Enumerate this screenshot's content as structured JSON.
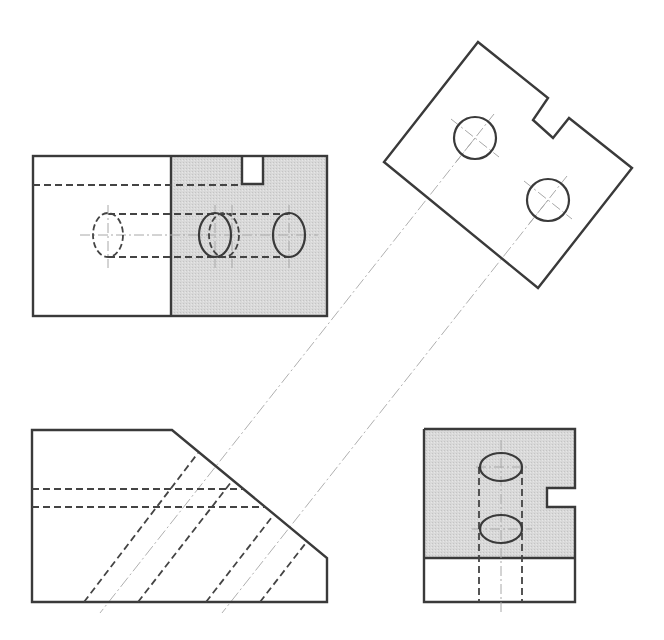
{
  "drawing": {
    "type": "orthographic-projection-with-auxiliary-view",
    "colors": {
      "line": "#3a3a3a",
      "shading": "#d6d6d6",
      "background": "#ffffff",
      "centerline": "#a8a8a8"
    },
    "views": [
      {
        "name": "auxiliary-view",
        "description": "Rotated true-shape view of inclined face with two circular holes and a rectangular notch"
      },
      {
        "name": "top-view",
        "description": "Rectangle divided into unshaded left and shaded right regions, with notch and hole ellipses"
      },
      {
        "name": "front-view",
        "description": "Pentagon profile with inclined face and hidden hole lines"
      },
      {
        "name": "right-side-view",
        "description": "Shaded rectangle with two elliptical holes and side notch"
      }
    ],
    "text_labels": []
  }
}
